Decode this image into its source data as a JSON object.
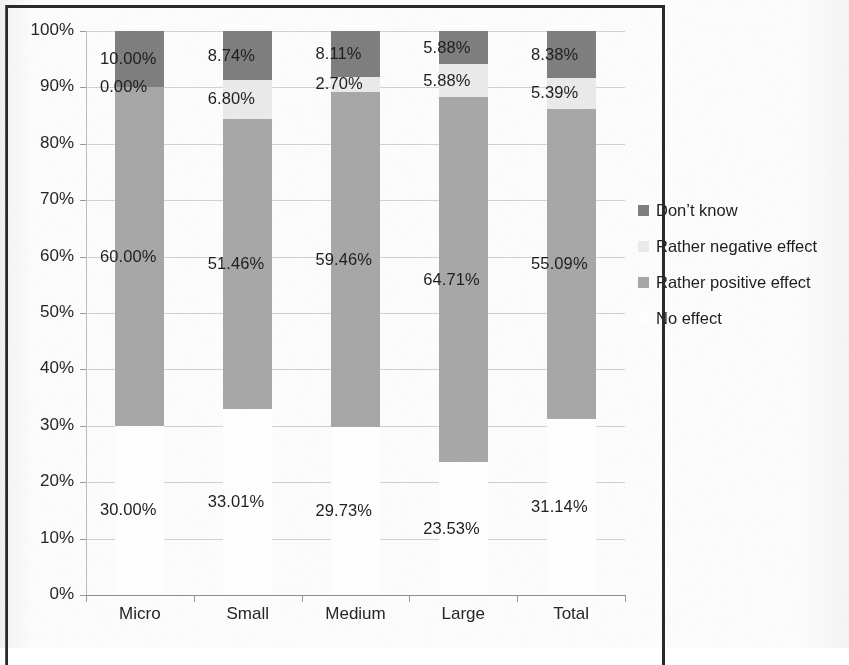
{
  "chart_data": {
    "type": "bar",
    "subtype": "stacked-100",
    "title": "",
    "xlabel": "",
    "ylabel": "",
    "ylim": [
      0,
      100
    ],
    "grid": true,
    "legend_position": "right",
    "categories": [
      "Micro",
      "Small",
      "Medium",
      "Large",
      "Total"
    ],
    "ytick_labels": [
      "0%",
      "10%",
      "20%",
      "30%",
      "40%",
      "50%",
      "60%",
      "70%",
      "80%",
      "90%",
      "100%"
    ],
    "ytick_values": [
      0,
      10,
      20,
      30,
      40,
      50,
      60,
      70,
      80,
      90,
      100
    ],
    "stack_order_bottom_to_top": [
      "No effect",
      "Rather positive effect",
      "Rather negative effect",
      "Don't know"
    ],
    "series": [
      {
        "name": "No effect",
        "color": "#ffffff",
        "values": [
          30.0,
          33.01,
          29.73,
          23.53,
          31.14
        ],
        "labels": [
          "30.00%",
          "33.01%",
          "29.73%",
          "23.53%",
          "31.14%"
        ]
      },
      {
        "name": "Rather positive effect",
        "color": "#a8a8a8",
        "values": [
          60.0,
          51.46,
          59.46,
          64.71,
          55.09
        ],
        "labels": [
          "60.00%",
          "51.46%",
          "59.46%",
          "64.71%",
          "55.09%"
        ]
      },
      {
        "name": "Rather negative effect",
        "color": "#ebebeb",
        "values": [
          0.0,
          6.8,
          2.7,
          5.88,
          5.39
        ],
        "labels": [
          "0.00%",
          "6.80%",
          "2.70%",
          "5.88%",
          "5.39%"
        ]
      },
      {
        "name": "Don't know",
        "color": "#7f7f7f",
        "values": [
          10.0,
          8.74,
          8.11,
          5.88,
          8.38
        ],
        "labels": [
          "10.00%",
          "8.74%",
          "8.11%",
          "5.88%",
          "8.38%"
        ]
      }
    ]
  },
  "legend": {
    "entries": [
      {
        "label": "Don’t know",
        "color": "#7f7f7f"
      },
      {
        "label": "Rather negative effect",
        "color": "#ebebeb"
      },
      {
        "label": "Rather positive effect",
        "color": "#a8a8a8"
      },
      {
        "label": "No effect",
        "color": "#ffffff"
      }
    ]
  },
  "axes": {
    "y_labels": [
      "100%",
      "90%",
      "80%",
      "70%",
      "60%",
      "50%",
      "40%",
      "30%",
      "20%",
      "10%",
      "0%"
    ],
    "x_labels": [
      "Micro",
      "Small",
      "Medium",
      "Large",
      "Total"
    ]
  }
}
